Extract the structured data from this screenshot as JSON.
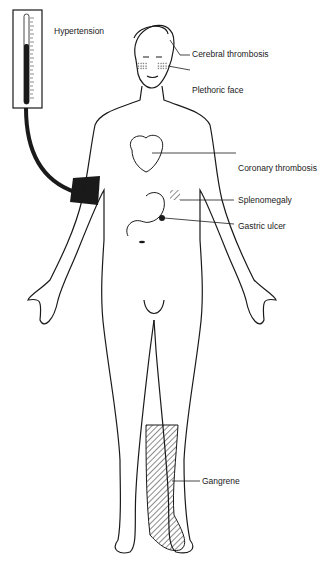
{
  "diagram": {
    "colors": {
      "ink": "#1a1a1a",
      "background": "#ffffff"
    },
    "labels": [
      {
        "id": "hypertension",
        "text": "Hypertension"
      },
      {
        "id": "cerebral",
        "text": "Cerebral thrombosis"
      },
      {
        "id": "plethoric",
        "text": "Plethoric face"
      },
      {
        "id": "coronary",
        "text": "Coronary thrombosis"
      },
      {
        "id": "spleno",
        "text": "Splenomegaly"
      },
      {
        "id": "gastric",
        "text": "Gastric ulcer"
      },
      {
        "id": "gangrene",
        "text": "Gangrene"
      }
    ]
  }
}
